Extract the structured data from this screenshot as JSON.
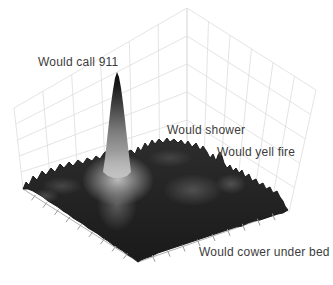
{
  "chart_data": {
    "type": "surface",
    "projection": "3d",
    "title": "",
    "axis_tick_labels": "none (unlabeled tick marks on the two front floor edges)",
    "legend": "none",
    "grid": "light gray wireframe on the two back walls",
    "annotations": [
      {
        "text": "Would call 911",
        "x": 38,
        "y": 56
      },
      {
        "text": "Would shower",
        "x": 167,
        "y": 124
      },
      {
        "text": "Would yell fire",
        "x": 217,
        "y": 146
      },
      {
        "text": "Would cower under bed",
        "x": 199,
        "y": 246
      }
    ],
    "series": [
      {
        "label": "Would call 911",
        "feature": "tall narrow central spike",
        "relative_height": 1.0
      },
      {
        "label": "Would shower",
        "feature": "broad low ridge right of center",
        "relative_height": 0.18
      },
      {
        "label": "Would yell fire",
        "feature": "small sharp spike at right",
        "relative_height": 0.15
      },
      {
        "label": "Would cower under bed",
        "feature": "flat dark foreground region",
        "relative_height": 0.04
      }
    ],
    "colors": {
      "background": "#ffffff",
      "grid": "#d9d9d9",
      "axis_line": "#b0b0b0",
      "tick": "#9a9a9a",
      "terrain_top": "#2d2d2d",
      "terrain_mid": "#232323",
      "terrain_bottom": "#1a1a1a",
      "terrain_edge": "#141414",
      "label_text": "#3c3c3c"
    },
    "geometry": {
      "walls": {
        "corner_top": [
          187,
          8
        ],
        "corner_bottom": [
          187,
          148
        ],
        "left_outer_top": [
          14,
          108
        ],
        "left_outer_bottom": [
          23,
          188
        ],
        "right_outer_top": [
          316,
          90
        ],
        "right_outer_bottom": [
          289,
          212
        ],
        "left_divisions": 6,
        "right_divisions": 6,
        "horizontal_divisions": 5
      },
      "silhouette": [
        [
          23,
          189
        ],
        [
          26,
          182
        ],
        [
          29,
          185
        ],
        [
          33,
          176
        ],
        [
          37,
          180
        ],
        [
          42,
          171
        ],
        [
          46,
          175
        ],
        [
          51,
          168
        ],
        [
          55,
          172
        ],
        [
          60,
          164
        ],
        [
          64,
          168
        ],
        [
          69,
          162
        ],
        [
          73,
          166
        ],
        [
          78,
          160
        ],
        [
          83,
          164
        ],
        [
          87,
          158
        ],
        [
          92,
          161
        ],
        [
          96,
          156
        ],
        [
          100,
          159
        ],
        [
          104,
          153
        ],
        [
          108,
          150
        ],
        [
          113,
          148
        ],
        [
          118,
          147
        ],
        [
          123,
          149
        ],
        [
          127,
          152
        ],
        [
          131,
          150
        ],
        [
          135,
          154
        ],
        [
          138,
          147
        ],
        [
          141,
          151
        ],
        [
          145,
          143
        ],
        [
          148,
          147
        ],
        [
          152,
          140
        ],
        [
          155,
          144
        ],
        [
          159,
          139
        ],
        [
          163,
          143
        ],
        [
          167,
          138
        ],
        [
          170,
          142
        ],
        [
          174,
          139
        ],
        [
          178,
          143
        ],
        [
          181,
          140
        ],
        [
          185,
          145
        ],
        [
          188,
          141
        ],
        [
          192,
          147
        ],
        [
          196,
          143
        ],
        [
          200,
          150
        ],
        [
          203,
          146
        ],
        [
          207,
          152
        ],
        [
          210,
          158
        ],
        [
          213,
          154
        ],
        [
          216,
          161
        ],
        [
          218,
          155
        ],
        [
          220,
          152
        ],
        [
          222,
          156
        ],
        [
          224,
          163
        ],
        [
          227,
          168
        ],
        [
          230,
          165
        ],
        [
          233,
          171
        ],
        [
          236,
          168
        ],
        [
          239,
          173
        ],
        [
          242,
          170
        ],
        [
          245,
          177
        ],
        [
          249,
          174
        ],
        [
          252,
          181
        ],
        [
          256,
          179
        ],
        [
          259,
          185
        ],
        [
          263,
          183
        ],
        [
          266,
          189
        ],
        [
          270,
          187
        ],
        [
          273,
          193
        ],
        [
          277,
          191
        ],
        [
          280,
          197
        ],
        [
          283,
          201
        ],
        [
          285,
          206
        ],
        [
          288,
          210
        ]
      ],
      "bottom_right_edge": [
        [
          288,
          210
        ],
        [
          283,
          213
        ],
        [
          278,
          214
        ],
        [
          272,
          216
        ],
        [
          266,
          218
        ],
        [
          260,
          220
        ],
        [
          254,
          221
        ],
        [
          248,
          223
        ],
        [
          242,
          226
        ],
        [
          236,
          227
        ],
        [
          230,
          229
        ],
        [
          224,
          231
        ],
        [
          218,
          233
        ],
        [
          212,
          235
        ],
        [
          206,
          237
        ],
        [
          200,
          239
        ],
        [
          194,
          241
        ],
        [
          188,
          243
        ],
        [
          182,
          245
        ],
        [
          176,
          247
        ],
        [
          170,
          249
        ],
        [
          164,
          251
        ],
        [
          158,
          253
        ],
        [
          152,
          256
        ],
        [
          146,
          258
        ],
        [
          141,
          260
        ],
        [
          138,
          262
        ]
      ],
      "bottom_left_edge": [
        [
          138,
          262
        ],
        [
          133,
          258
        ],
        [
          128,
          255
        ],
        [
          123,
          251
        ],
        [
          118,
          248
        ],
        [
          113,
          245
        ],
        [
          108,
          241
        ],
        [
          103,
          238
        ],
        [
          98,
          234
        ],
        [
          93,
          231
        ],
        [
          88,
          228
        ],
        [
          83,
          224
        ],
        [
          78,
          221
        ],
        [
          73,
          218
        ],
        [
          68,
          214
        ],
        [
          63,
          211
        ],
        [
          58,
          207
        ],
        [
          53,
          204
        ],
        [
          48,
          201
        ],
        [
          43,
          197
        ],
        [
          38,
          194
        ],
        [
          33,
          191
        ],
        [
          28,
          189
        ],
        [
          23,
          189
        ]
      ],
      "spire": {
        "points": [
          [
            103,
            172
          ],
          [
            105,
            158
          ],
          [
            107,
            140
          ],
          [
            109,
            122
          ],
          [
            111,
            104
          ],
          [
            113,
            90
          ],
          [
            115,
            78
          ],
          [
            117,
            72
          ],
          [
            119,
            77
          ],
          [
            121,
            88
          ],
          [
            123,
            103
          ],
          [
            125,
            120
          ],
          [
            127,
            138
          ],
          [
            129,
            155
          ],
          [
            131,
            172
          ],
          [
            127,
            176
          ],
          [
            121,
            178
          ],
          [
            114,
            178
          ],
          [
            108,
            176
          ]
        ],
        "gradient_x": 117,
        "gradient_y1": 72,
        "gradient_y2": 178,
        "stops": [
          [
            "0%",
            "#0d0d0d"
          ],
          [
            "12%",
            "#171717"
          ],
          [
            "30%",
            "#3f3f3f"
          ],
          [
            "55%",
            "#7a7a7a"
          ],
          [
            "80%",
            "#a5a5a5"
          ],
          [
            "100%",
            "#bcbcbc"
          ]
        ]
      },
      "glows": [
        {
          "cx": 118,
          "cy": 180,
          "rx": 36,
          "ry": 26,
          "rgb": "195,195,195",
          "alpha": 0.95
        },
        {
          "cx": 117,
          "cy": 205,
          "rx": 20,
          "ry": 26,
          "rgb": "160,160,160",
          "alpha": 0.45
        },
        {
          "cx": 193,
          "cy": 190,
          "rx": 30,
          "ry": 16,
          "rgb": "150,150,150",
          "alpha": 0.38
        },
        {
          "cx": 231,
          "cy": 184,
          "rx": 15,
          "ry": 10,
          "rgb": "160,160,160",
          "alpha": 0.35
        },
        {
          "cx": 62,
          "cy": 186,
          "rx": 20,
          "ry": 9,
          "rgb": "145,145,145",
          "alpha": 0.3
        },
        {
          "cx": 170,
          "cy": 158,
          "rx": 22,
          "ry": 9,
          "rgb": "130,130,130",
          "alpha": 0.3
        },
        {
          "cx": 45,
          "cy": 196,
          "rx": 14,
          "ry": 7,
          "rgb": "155,155,155",
          "alpha": 0.32
        }
      ],
      "ticks": {
        "left_edge": {
          "from": [
            23,
            189
          ],
          "to": [
            138,
            262
          ],
          "count": 9,
          "dir": [
            -3,
            4
          ]
        },
        "right_edge": {
          "from": [
            138,
            262
          ],
          "to": [
            288,
            210
          ],
          "count": 9,
          "dir": [
            2,
            5
          ]
        }
      }
    }
  }
}
